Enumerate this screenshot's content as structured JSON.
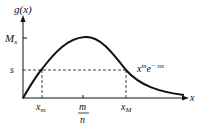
{
  "diagram": {
    "y_axis_label": "g(x)",
    "x_axis_label": "x",
    "curve_label_base": "x",
    "curve_label_exp1": "m",
    "curve_label_e": "e",
    "curve_label_exp2": "− nx",
    "y_tick_max": "M",
    "y_tick_max_sub": "x",
    "y_tick_s": "s",
    "x_tick_xm": "x",
    "x_tick_xm_sub": "m",
    "x_tick_mode_num": "m",
    "x_tick_mode_den": "n",
    "x_tick_xM": "x",
    "x_tick_xM_sub": "M"
  }
}
